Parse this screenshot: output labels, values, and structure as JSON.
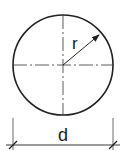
{
  "diagram": {
    "type": "circle-dimension-drawing",
    "labels": {
      "radius": "r",
      "diameter": "d"
    },
    "colors": {
      "stroke": "#222222",
      "centerline": "#333333",
      "background": "#ffffff"
    }
  }
}
